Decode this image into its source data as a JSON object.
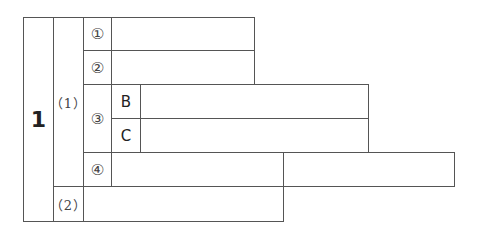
{
  "table": {
    "main_label": "1",
    "sub1_label": "（1）",
    "sub2_label": "（2）",
    "items": {
      "item1": "①",
      "item2": "②",
      "item3": "③",
      "item4": "④"
    },
    "sub_items": {
      "b": "B",
      "c": "C"
    },
    "answers": {
      "item1": "",
      "item2": "",
      "b": "",
      "c": "",
      "item4_a": "",
      "item4_b": "",
      "sub2": ""
    }
  }
}
